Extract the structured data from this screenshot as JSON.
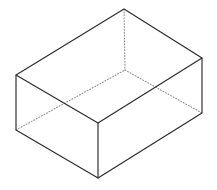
{
  "figure": {
    "shape_type": "rectangular-box-open-top",
    "projection": "isometric",
    "canvas": {
      "width": 217,
      "height": 190,
      "background": "#ffffff"
    },
    "style": {
      "visible_edge_color": "#2b2b2b",
      "hidden_edge_color": "#8c8c8c",
      "visible_edge_width": 1.15,
      "hidden_edge_width": 1.05,
      "hidden_edge_dash": "1 1.9",
      "face_fill": "#ffffff"
    },
    "vertices": {
      "top_back": {
        "x": 124,
        "y": 9,
        "label": "back-top corner (apex)",
        "hidden": false
      },
      "top_left": {
        "x": 16,
        "y": 75,
        "label": "left-top corner",
        "hidden": false
      },
      "top_right": {
        "x": 202,
        "y": 58,
        "label": "right-top corner",
        "hidden": false
      },
      "top_front": {
        "x": 98,
        "y": 123,
        "label": "front-top corner",
        "hidden": false
      },
      "bot_back": {
        "x": 125,
        "y": 70,
        "label": "back-bottom corner",
        "hidden": true
      },
      "bot_left": {
        "x": 16,
        "y": 130,
        "label": "left-bottom corner",
        "hidden": false
      },
      "bot_right": {
        "x": 202,
        "y": 113,
        "label": "right-bottom corner",
        "hidden": false
      },
      "bot_front": {
        "x": 98,
        "y": 178,
        "label": "front-bottom corner",
        "hidden": false
      }
    },
    "faces": [
      {
        "name": "top-opening",
        "points": "124,9 202,58 98,123 16,75"
      },
      {
        "name": "left-face",
        "points": "16,75 98,123 98,178 16,130"
      },
      {
        "name": "right-face",
        "points": "98,123 202,58 202,113 98,178"
      }
    ],
    "edges": [
      {
        "name": "top-rim-back-left",
        "from": "top_back",
        "to": "top_left",
        "hidden": false
      },
      {
        "name": "top-rim-back-right",
        "from": "top_back",
        "to": "top_right",
        "hidden": false
      },
      {
        "name": "top-rim-front-left",
        "from": "top_left",
        "to": "top_front",
        "hidden": false
      },
      {
        "name": "top-rim-front-right",
        "from": "top_front",
        "to": "top_right",
        "hidden": false
      },
      {
        "name": "vertical-left",
        "from": "top_left",
        "to": "bot_left",
        "hidden": false
      },
      {
        "name": "vertical-front",
        "from": "top_front",
        "to": "bot_front",
        "hidden": false
      },
      {
        "name": "vertical-right",
        "from": "top_right",
        "to": "bot_right",
        "hidden": false
      },
      {
        "name": "vertical-back-hidden",
        "from": "top_back",
        "to": "bot_back",
        "hidden": true
      },
      {
        "name": "base-front-left",
        "from": "bot_left",
        "to": "bot_front",
        "hidden": false
      },
      {
        "name": "base-front-right",
        "from": "bot_front",
        "to": "bot_right",
        "hidden": false
      },
      {
        "name": "base-back-left",
        "from": "bot_left",
        "to": "bot_back",
        "hidden": true
      },
      {
        "name": "base-back-right",
        "from": "bot_back",
        "to": "bot_right",
        "hidden": true
      }
    ],
    "edge_paths": {
      "solid": "M 124,9 L 16,75 L 98,123 L 202,58 Z M 16,75 L 16,130 L 98,178 L 98,123 M 98,178 L 202,113 L 202,58",
      "hidden": "M 124,9 L 125,70 M 125,70 L 16,130 M 125,70 L 202,113"
    }
  }
}
